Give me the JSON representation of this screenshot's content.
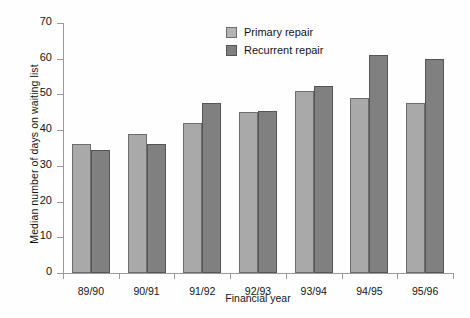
{
  "chart_data": {
    "type": "bar",
    "title": "",
    "xlabel": "Financial year",
    "ylabel": "Median number of days on waiting list",
    "categories": [
      "89/90",
      "90/91",
      "91/92",
      "92/93",
      "93/94",
      "94/95",
      "95/96"
    ],
    "series": [
      {
        "name": "Primary repair",
        "color": "#a9a9a9",
        "values": [
          36,
          39,
          42,
          45,
          51,
          49,
          47.5
        ]
      },
      {
        "name": "Recurrent repair",
        "color": "#808080",
        "values": [
          34.5,
          36,
          47.5,
          45.5,
          52.5,
          61,
          60
        ]
      }
    ],
    "ylim": [
      0,
      70
    ],
    "yticks": [
      0,
      10,
      20,
      30,
      40,
      50,
      60,
      70
    ],
    "ytick_labels": [
      "0",
      "10",
      "20",
      "30",
      "40",
      "50",
      "60",
      "70"
    ],
    "grid": false,
    "legend_position": "top-center"
  }
}
